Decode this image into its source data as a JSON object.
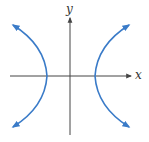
{
  "figure": {
    "type": "hyperbola",
    "axes": {
      "x_label": "x",
      "y_label": "y"
    },
    "colors": {
      "curve": "#3a7bc8",
      "axis": "#444444",
      "background": "#ffffff"
    },
    "branches": [
      {
        "name": "left",
        "opens": "left",
        "arrows": [
          "up-left",
          "down-left"
        ]
      },
      {
        "name": "right",
        "opens": "right",
        "arrows": [
          "up-right",
          "down-right"
        ]
      }
    ]
  }
}
